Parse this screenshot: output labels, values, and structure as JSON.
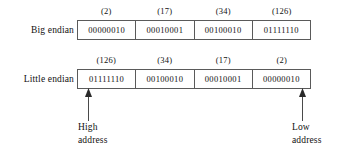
{
  "figure": {
    "rows": [
      {
        "id": "big-endian",
        "label": "Big endian",
        "captions": [
          "(2)",
          "(17)",
          "(34)",
          "(126)"
        ],
        "bytes": [
          "00000010",
          "00010001",
          "00100010",
          "01111110"
        ]
      },
      {
        "id": "little-endian",
        "label": "Little endian",
        "captions": [
          "(126)",
          "(34)",
          "(17)",
          "(2)"
        ],
        "bytes": [
          "01111110",
          "00100010",
          "00010001",
          "00000010"
        ]
      }
    ],
    "pointers": [
      {
        "id": "high-address",
        "icon": "arrow-up-icon",
        "line1": "High",
        "line2": "address"
      },
      {
        "id": "low-address",
        "icon": "arrow-up-icon",
        "line1": "Low",
        "line2": "address"
      }
    ],
    "colors": {
      "background": "#ffffff",
      "border": "#5a5a5a",
      "text": "#111111"
    }
  }
}
